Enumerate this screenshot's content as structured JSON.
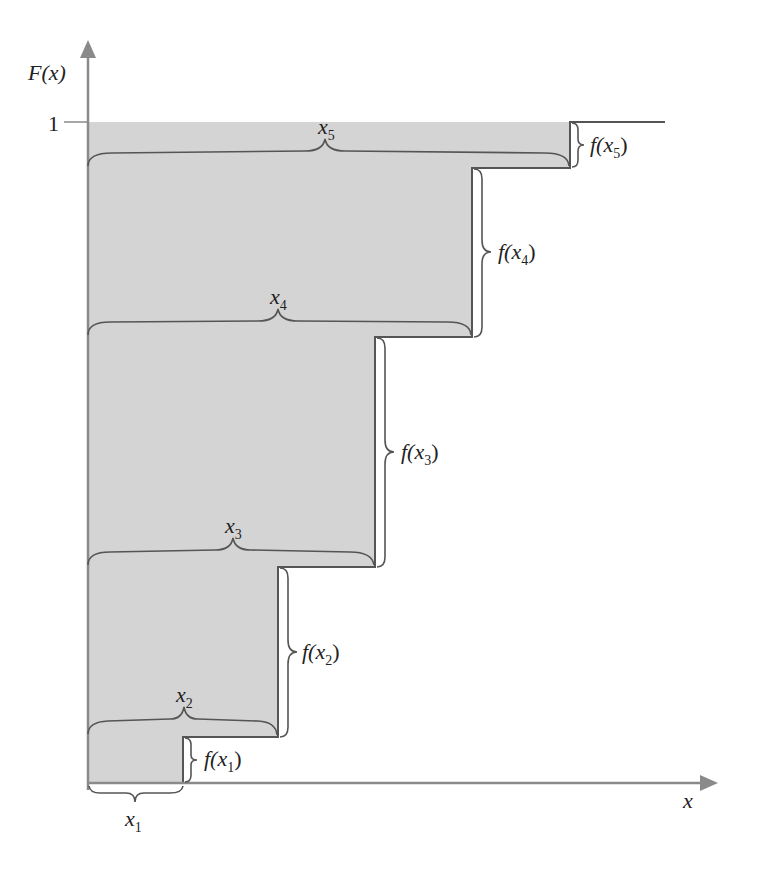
{
  "diagram": {
    "y_axis_label": "F(x)",
    "x_axis_label": "x",
    "y_tick_label": "1",
    "colors": {
      "fill": "#d4d4d4",
      "axis": "#8a8a8a",
      "line": "#555555",
      "brace": "#555555",
      "text": "#222222"
    },
    "steps": [
      {
        "x_label": "x",
        "x_sub": "1",
        "jump_label_f": "f(x",
        "jump_sub": "1",
        "jump_close": ")"
      },
      {
        "x_label": "x",
        "x_sub": "2",
        "jump_label_f": "f(x",
        "jump_sub": "2",
        "jump_close": ")"
      },
      {
        "x_label": "x",
        "x_sub": "3",
        "jump_label_f": "f(x",
        "jump_sub": "3",
        "jump_close": ")"
      },
      {
        "x_label": "x",
        "x_sub": "4",
        "jump_label_f": "f(x",
        "jump_sub": "4",
        "jump_close": ")"
      },
      {
        "x_label": "x",
        "x_sub": "5",
        "jump_label_f": "f(x",
        "jump_sub": "5",
        "jump_close": ")"
      }
    ]
  }
}
